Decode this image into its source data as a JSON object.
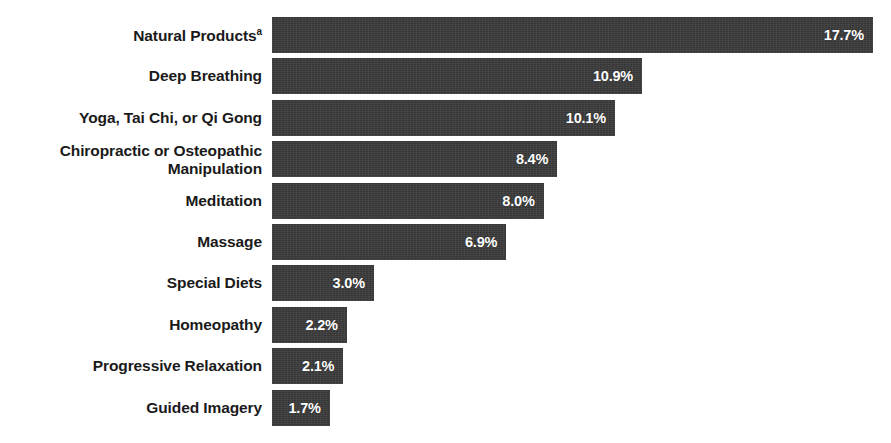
{
  "chart_data": {
    "type": "bar",
    "orientation": "horizontal",
    "title": "",
    "subtitle": "",
    "xlabel": "",
    "ylabel": "",
    "grid": false,
    "legend": null,
    "xlim": [
      0,
      17.7
    ],
    "units": "percent",
    "categories": [
      "Natural Products",
      "Deep Breathing",
      "Yoga, Tai Chi, or Qi Gong",
      "Chiropractic or Osteopathic\nManipulation",
      "Meditation",
      "Massage",
      "Special Diets",
      "Homeopathy",
      "Progressive Relaxation",
      "Guided Imagery"
    ],
    "category_footnotes": [
      "a",
      "",
      "",
      "",
      "",
      "",
      "",
      "",
      "",
      ""
    ],
    "values": [
      17.7,
      10.9,
      10.1,
      8.4,
      8.0,
      6.9,
      3.0,
      2.2,
      2.1,
      1.7
    ],
    "value_labels": [
      "17.7%",
      "10.9%",
      "10.1%",
      "8.4%",
      "8.0%",
      "6.9%",
      "3.0%",
      "2.2%",
      "2.1%",
      "1.7%"
    ],
    "colors": {
      "bar": "#3b3b3b",
      "background": "#ffffff",
      "category_text": "#1a1a1a",
      "value_text": "#ffffff"
    }
  },
  "layout": {
    "bar_origin_x": 272,
    "px_per_percent": 33.95,
    "first_bar_top": 17,
    "bar_height": 36,
    "bar_pitch": 41.4
  }
}
